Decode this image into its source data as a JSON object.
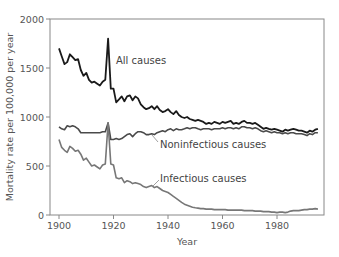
{
  "chart_data": {
    "type": "line",
    "title": "",
    "xlabel": "Year",
    "ylabel": "Mortality rate per 100,000 per year",
    "xlim": [
      1897,
      1997
    ],
    "ylim": [
      0,
      2000
    ],
    "xticks": [
      1900,
      1920,
      1940,
      1960,
      1980
    ],
    "yticks": [
      0,
      500,
      1000,
      1500,
      2000
    ],
    "grid": false,
    "legend": "inline labels",
    "x": [
      1900,
      1901,
      1902,
      1903,
      1904,
      1905,
      1906,
      1907,
      1908,
      1909,
      1910,
      1911,
      1912,
      1913,
      1914,
      1915,
      1916,
      1917,
      1918,
      1919,
      1920,
      1921,
      1922,
      1923,
      1924,
      1925,
      1926,
      1927,
      1928,
      1929,
      1930,
      1931,
      1932,
      1933,
      1934,
      1935,
      1936,
      1937,
      1938,
      1939,
      1940,
      1941,
      1942,
      1943,
      1944,
      1945,
      1946,
      1947,
      1948,
      1949,
      1950,
      1951,
      1952,
      1953,
      1954,
      1955,
      1956,
      1957,
      1958,
      1959,
      1960,
      1961,
      1962,
      1963,
      1964,
      1965,
      1966,
      1967,
      1968,
      1969,
      1970,
      1971,
      1972,
      1973,
      1974,
      1975,
      1976,
      1977,
      1978,
      1979,
      1980,
      1981,
      1982,
      1983,
      1984,
      1985,
      1986,
      1987,
      1988,
      1989,
      1990,
      1991,
      1992,
      1993,
      1994,
      1995
    ],
    "series": [
      {
        "name": "All causes",
        "color": "#1a1a1a",
        "values": [
          1700,
          1620,
          1540,
          1560,
          1640,
          1610,
          1580,
          1590,
          1480,
          1420,
          1450,
          1380,
          1350,
          1360,
          1340,
          1320,
          1360,
          1380,
          1800,
          1290,
          1290,
          1150,
          1180,
          1210,
          1160,
          1210,
          1220,
          1170,
          1210,
          1190,
          1130,
          1100,
          1080,
          1090,
          1110,
          1080,
          1110,
          1070,
          1050,
          1060,
          1080,
          1050,
          1030,
          1060,
          1020,
          1000,
          990,
          1000,
          980,
          970,
          960,
          970,
          960,
          950,
          930,
          940,
          930,
          950,
          940,
          930,
          950,
          940,
          950,
          960,
          930,
          940,
          930,
          950,
          960,
          940,
          940,
          930,
          940,
          920,
          900,
          880,
          890,
          880,
          870,
          880,
          870,
          860,
          850,
          870,
          860,
          870,
          880,
          870,
          860,
          860,
          850,
          840,
          860,
          850,
          870,
          880
        ]
      },
      {
        "name": "Noninfectious causes",
        "color": "#4a4a4a",
        "values": [
          900,
          880,
          870,
          910,
          900,
          910,
          900,
          880,
          840,
          840,
          840,
          840,
          840,
          840,
          840,
          840,
          850,
          850,
          940,
          770,
          770,
          780,
          770,
          780,
          800,
          820,
          830,
          800,
          830,
          850,
          850,
          840,
          820,
          820,
          830,
          820,
          840,
          850,
          860,
          850,
          870,
          880,
          860,
          880,
          870,
          870,
          880,
          890,
          880,
          890,
          890,
          880,
          870,
          880,
          880,
          880,
          870,
          880,
          880,
          880,
          890,
          880,
          890,
          890,
          880,
          890,
          880,
          900,
          900,
          890,
          890,
          880,
          890,
          880,
          860,
          850,
          860,
          850,
          840,
          850,
          840,
          840,
          830,
          840,
          830,
          840,
          840,
          830,
          830,
          830,
          820,
          810,
          830,
          820,
          840,
          840
        ]
      },
      {
        "name": "Infectious causes",
        "color": "#777777",
        "values": [
          770,
          690,
          660,
          640,
          700,
          680,
          650,
          660,
          620,
          560,
          580,
          540,
          500,
          510,
          490,
          470,
          510,
          520,
          940,
          520,
          510,
          380,
          370,
          380,
          330,
          350,
          340,
          320,
          330,
          320,
          310,
          290,
          280,
          290,
          300,
          280,
          290,
          270,
          250,
          240,
          230,
          210,
          190,
          170,
          150,
          130,
          110,
          100,
          90,
          80,
          75,
          70,
          65,
          65,
          60,
          60,
          60,
          55,
          55,
          55,
          55,
          55,
          50,
          50,
          50,
          50,
          50,
          50,
          45,
          45,
          45,
          45,
          40,
          40,
          40,
          35,
          35,
          35,
          30,
          30,
          25,
          30,
          30,
          25,
          30,
          40,
          45,
          45,
          45,
          50,
          55,
          55,
          60,
          60,
          65,
          60
        ]
      }
    ],
    "annotations": [
      {
        "text": "All causes",
        "year": 1920,
        "value": 1540
      },
      {
        "text": "Noninfectious causes",
        "year": 1938,
        "value": 720,
        "leader_to": [
          1935,
          820
        ]
      },
      {
        "text": "Infectious causes",
        "year": 1938,
        "value": 380,
        "leader_to": [
          1935,
          300
        ]
      }
    ]
  },
  "labels": {
    "x_ticks": [
      "1900",
      "1920",
      "1940",
      "1960",
      "1980"
    ],
    "y_ticks": [
      "0",
      "500",
      "1000",
      "1500",
      "2000"
    ],
    "xlabel": "Year",
    "ylabel": "Mortality rate per 100,000 per year",
    "series": [
      "All causes",
      "Noninfectious causes",
      "Infectious causes"
    ]
  }
}
